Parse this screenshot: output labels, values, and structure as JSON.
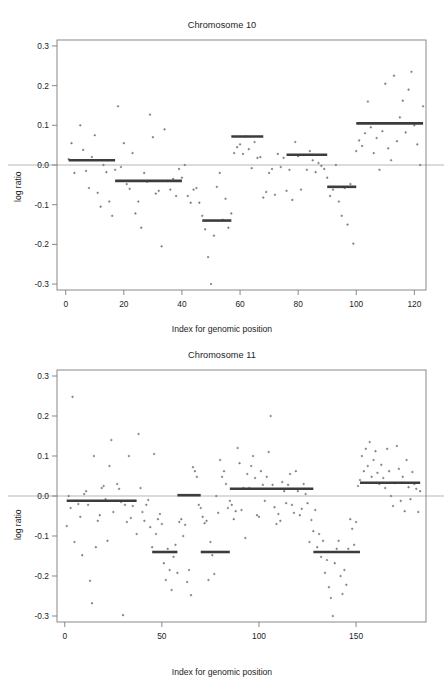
{
  "page_header": {
    "left": "",
    "right": ""
  },
  "axis_titles": {
    "x": "Index for genomic position",
    "y": "log ratio"
  },
  "colors": {
    "point": "#6f6f6f",
    "segment": "#3c3c3c",
    "zero_line": "#cfcfcf",
    "frame": "#7c7c7c",
    "text": "#1d1d1d"
  },
  "chart_data": [
    {
      "type": "scatter",
      "title": "Chromosome 10",
      "xlabel": "Index for genomic position",
      "ylabel": "log ratio",
      "xlim": [
        -3,
        124
      ],
      "ylim": [
        -0.315,
        0.315
      ],
      "xticks": [
        0,
        20,
        40,
        60,
        80,
        100,
        120
      ],
      "yticks": [
        -0.3,
        -0.2,
        -0.1,
        0.0,
        0.1,
        0.2,
        0.3
      ],
      "ytick_labels": [
        "-0.3",
        "-0.2",
        "-0.1",
        "0.0",
        "0.1",
        "0.2",
        "0.3"
      ],
      "grid": false,
      "legend": "none",
      "zero_line": 0.0,
      "points": [
        [
          1,
          0.015
        ],
        [
          2,
          0.055
        ],
        [
          3,
          -0.02
        ],
        [
          4,
          0.012
        ],
        [
          5,
          0.1
        ],
        [
          6,
          0.038
        ],
        [
          7,
          -0.015
        ],
        [
          8,
          -0.058
        ],
        [
          9,
          0.02
        ],
        [
          10,
          0.075
        ],
        [
          11,
          -0.07
        ],
        [
          12,
          -0.105
        ],
        [
          13,
          0.0
        ],
        [
          14,
          -0.018
        ],
        [
          15,
          -0.092
        ],
        [
          16,
          -0.128
        ],
        [
          17,
          -0.012
        ],
        [
          18,
          0.148
        ],
        [
          19,
          -0.005
        ],
        [
          20,
          0.055
        ],
        [
          21,
          -0.048
        ],
        [
          22,
          -0.06
        ],
        [
          23,
          0.03
        ],
        [
          24,
          -0.122
        ],
        [
          25,
          -0.092
        ],
        [
          26,
          -0.158
        ],
        [
          27,
          -0.02
        ],
        [
          28,
          -0.042
        ],
        [
          29,
          0.127
        ],
        [
          30,
          0.07
        ],
        [
          31,
          -0.072
        ],
        [
          32,
          -0.065
        ],
        [
          33,
          -0.205
        ],
        [
          34,
          0.09
        ],
        [
          35,
          -0.04
        ],
        [
          36,
          -0.062
        ],
        [
          37,
          -0.035
        ],
        [
          38,
          -0.078
        ],
        [
          39,
          -0.01
        ],
        [
          40,
          -0.032
        ],
        [
          41,
          0.0
        ],
        [
          42,
          -0.078
        ],
        [
          43,
          -0.095
        ],
        [
          44,
          -0.062
        ],
        [
          45,
          -0.058
        ],
        [
          46,
          -0.095
        ],
        [
          47,
          -0.128
        ],
        [
          48,
          -0.162
        ],
        [
          49,
          -0.232
        ],
        [
          50,
          -0.3
        ],
        [
          51,
          -0.178
        ],
        [
          52,
          -0.055
        ],
        [
          53,
          -0.02
        ],
        [
          54,
          -0.138
        ],
        [
          55,
          -0.085
        ],
        [
          56,
          -0.158
        ],
        [
          57,
          -0.122
        ],
        [
          58,
          0.03
        ],
        [
          59,
          0.045
        ],
        [
          60,
          0.052
        ],
        [
          61,
          0.028
        ],
        [
          62,
          0.072
        ],
        [
          63,
          0.04
        ],
        [
          64,
          -0.008
        ],
        [
          65,
          0.058
        ],
        [
          66,
          0.018
        ],
        [
          67,
          0.02
        ],
        [
          68,
          -0.082
        ],
        [
          69,
          -0.068
        ],
        [
          70,
          -0.02
        ],
        [
          71,
          -0.01
        ],
        [
          72,
          -0.075
        ],
        [
          73,
          0.028
        ],
        [
          74,
          -0.005
        ],
        [
          75,
          0.018
        ],
        [
          76,
          -0.065
        ],
        [
          77,
          -0.012
        ],
        [
          78,
          -0.088
        ],
        [
          79,
          0.058
        ],
        [
          80,
          0.022
        ],
        [
          81,
          -0.062
        ],
        [
          82,
          0.025
        ],
        [
          83,
          -0.012
        ],
        [
          84,
          0.035
        ],
        [
          85,
          0.012
        ],
        [
          86,
          -0.018
        ],
        [
          87,
          0.005
        ],
        [
          88,
          -0.002
        ],
        [
          89,
          -0.01
        ],
        [
          90,
          -0.032
        ],
        [
          91,
          -0.078
        ],
        [
          92,
          -0.062
        ],
        [
          93,
          0.0
        ],
        [
          94,
          -0.092
        ],
        [
          95,
          -0.128
        ],
        [
          96,
          -0.058
        ],
        [
          97,
          -0.15
        ],
        [
          98,
          -0.048
        ],
        [
          99,
          -0.198
        ],
        [
          100,
          0.035
        ],
        [
          101,
          0.062
        ],
        [
          102,
          0.048
        ],
        [
          103,
          0.08
        ],
        [
          104,
          0.16
        ],
        [
          105,
          0.095
        ],
        [
          106,
          0.03
        ],
        [
          107,
          0.068
        ],
        [
          108,
          -0.012
        ],
        [
          109,
          0.085
        ],
        [
          110,
          0.205
        ],
        [
          111,
          0.042
        ],
        [
          112,
          0.012
        ],
        [
          113,
          0.225
        ],
        [
          114,
          0.06
        ],
        [
          115,
          0.12
        ],
        [
          116,
          0.162
        ],
        [
          117,
          0.082
        ],
        [
          118,
          0.19
        ],
        [
          119,
          0.235
        ],
        [
          120,
          0.1
        ],
        [
          121,
          0.052
        ],
        [
          122,
          0.0
        ],
        [
          123,
          0.148
        ]
      ],
      "segments": [
        {
          "x0": 1,
          "x1": 17,
          "value": 0.012
        },
        {
          "x0": 17,
          "x1": 40,
          "value": -0.04
        },
        {
          "x0": 47,
          "x1": 57,
          "value": -0.14
        },
        {
          "x0": 57,
          "x1": 68,
          "value": 0.072
        },
        {
          "x0": 76,
          "x1": 90,
          "value": 0.026
        },
        {
          "x0": 90,
          "x1": 100,
          "value": -0.055
        },
        {
          "x0": 100,
          "x1": 123,
          "value": 0.105
        }
      ]
    },
    {
      "type": "scatter",
      "title": "Chromosome 11",
      "xlabel": "Index for genomic position",
      "ylabel": "log ratio",
      "xlim": [
        -4,
        186
      ],
      "ylim": [
        -0.315,
        0.315
      ],
      "xticks": [
        0,
        50,
        100,
        150
      ],
      "yticks": [
        -0.3,
        -0.2,
        -0.1,
        0.0,
        0.1,
        0.2,
        0.3
      ],
      "ytick_labels": [
        "-0.3",
        "-0.2",
        "-0.1",
        "0.0",
        "0.1",
        "0.2",
        "0.3"
      ],
      "grid": false,
      "legend": "none",
      "zero_line": 0.0,
      "points": [
        [
          1,
          -0.075
        ],
        [
          2,
          0.0
        ],
        [
          3,
          -0.03
        ],
        [
          4,
          0.248
        ],
        [
          5,
          -0.115
        ],
        [
          6,
          -0.012
        ],
        [
          7,
          -0.02
        ],
        [
          8,
          -0.052
        ],
        [
          9,
          -0.148
        ],
        [
          10,
          0.005
        ],
        [
          11,
          0.012
        ],
        [
          12,
          -0.022
        ],
        [
          13,
          -0.212
        ],
        [
          14,
          -0.268
        ],
        [
          15,
          0.1
        ],
        [
          16,
          -0.128
        ],
        [
          17,
          -0.062
        ],
        [
          18,
          -0.048
        ],
        [
          19,
          0.02
        ],
        [
          20,
          0.025
        ],
        [
          21,
          -0.008
        ],
        [
          22,
          -0.112
        ],
        [
          23,
          0.075
        ],
        [
          24,
          0.14
        ],
        [
          25,
          -0.04
        ],
        [
          26,
          -0.012
        ],
        [
          27,
          0.03
        ],
        [
          28,
          0.018
        ],
        [
          29,
          -0.015
        ],
        [
          30,
          -0.298
        ],
        [
          31,
          -0.022
        ],
        [
          32,
          -0.065
        ],
        [
          33,
          0.1
        ],
        [
          34,
          -0.055
        ],
        [
          35,
          -0.025
        ],
        [
          36,
          -0.012
        ],
        [
          37,
          -0.095
        ],
        [
          38,
          0.155
        ],
        [
          39,
          0.02
        ],
        [
          40,
          -0.04
        ],
        [
          41,
          -0.062
        ],
        [
          42,
          -0.022
        ],
        [
          43,
          -0.01
        ],
        [
          44,
          -0.078
        ],
        [
          45,
          -0.128
        ],
        [
          46,
          0.105
        ],
        [
          47,
          -0.095
        ],
        [
          48,
          -0.058
        ],
        [
          49,
          -0.045
        ],
        [
          50,
          -0.07
        ],
        [
          51,
          -0.168
        ],
        [
          52,
          -0.21
        ],
        [
          53,
          -0.132
        ],
        [
          54,
          -0.185
        ],
        [
          55,
          -0.235
        ],
        [
          56,
          -0.152
        ],
        [
          57,
          -0.122
        ],
        [
          58,
          -0.192
        ],
        [
          59,
          -0.065
        ],
        [
          60,
          -0.058
        ],
        [
          61,
          -0.1
        ],
        [
          62,
          -0.072
        ],
        [
          63,
          -0.215
        ],
        [
          64,
          -0.185
        ],
        [
          65,
          -0.248
        ],
        [
          66,
          0.072
        ],
        [
          67,
          0.062
        ],
        [
          68,
          0.048
        ],
        [
          69,
          -0.022
        ],
        [
          70,
          -0.03
        ],
        [
          71,
          -0.052
        ],
        [
          72,
          -0.068
        ],
        [
          73,
          -0.062
        ],
        [
          74,
          -0.21
        ],
        [
          75,
          -0.115
        ],
        [
          76,
          -0.148
        ],
        [
          77,
          -0.195
        ],
        [
          78,
          0.0
        ],
        [
          79,
          -0.042
        ],
        [
          80,
          0.09
        ],
        [
          81,
          0.048
        ],
        [
          82,
          0.062
        ],
        [
          83,
          0.03
        ],
        [
          84,
          -0.03
        ],
        [
          85,
          -0.012
        ],
        [
          86,
          -0.022
        ],
        [
          87,
          -0.058
        ],
        [
          88,
          -0.038
        ],
        [
          89,
          0.12
        ],
        [
          90,
          0.082
        ],
        [
          91,
          -0.035
        ],
        [
          92,
          0.02
        ],
        [
          93,
          -0.105
        ],
        [
          94,
          0.055
        ],
        [
          95,
          0.02
        ],
        [
          96,
          0.075
        ],
        [
          97,
          0.1
        ],
        [
          98,
          0.045
        ],
        [
          99,
          -0.048
        ],
        [
          100,
          -0.052
        ],
        [
          101,
          0.062
        ],
        [
          102,
          0.028
        ],
        [
          103,
          -0.012
        ],
        [
          104,
          0.048
        ],
        [
          105,
          0.11
        ],
        [
          106,
          0.2
        ],
        [
          107,
          0.028
        ],
        [
          108,
          -0.028
        ],
        [
          109,
          -0.07
        ],
        [
          110,
          -0.045
        ],
        [
          111,
          -0.062
        ],
        [
          112,
          0.035
        ],
        [
          113,
          0.012
        ],
        [
          114,
          -0.018
        ],
        [
          115,
          0.028
        ],
        [
          116,
          0.055
        ],
        [
          117,
          -0.022
        ],
        [
          118,
          -0.042
        ],
        [
          119,
          0.062
        ],
        [
          120,
          0.012
        ],
        [
          121,
          -0.048
        ],
        [
          122,
          -0.032
        ],
        [
          123,
          0.03
        ],
        [
          124,
          0.005
        ],
        [
          125,
          -0.018
        ],
        [
          126,
          -0.115
        ],
        [
          127,
          -0.06
        ],
        [
          128,
          -0.088
        ],
        [
          129,
          -0.035
        ],
        [
          130,
          -0.128
        ],
        [
          131,
          -0.095
        ],
        [
          132,
          -0.152
        ],
        [
          133,
          -0.112
        ],
        [
          134,
          -0.192
        ],
        [
          135,
          -0.16
        ],
        [
          136,
          -0.228
        ],
        [
          137,
          -0.255
        ],
        [
          138,
          -0.3
        ],
        [
          139,
          -0.168
        ],
        [
          140,
          -0.132
        ],
        [
          141,
          -0.112
        ],
        [
          142,
          -0.2
        ],
        [
          143,
          -0.245
        ],
        [
          144,
          -0.185
        ],
        [
          145,
          -0.222
        ],
        [
          146,
          -0.132
        ],
        [
          147,
          -0.058
        ],
        [
          148,
          -0.082
        ],
        [
          149,
          -0.122
        ],
        [
          150,
          -0.065
        ],
        [
          151,
          0.025
        ],
        [
          152,
          0.04
        ],
        [
          153,
          0.1
        ],
        [
          154,
          0.062
        ],
        [
          155,
          0.118
        ],
        [
          156,
          0.075
        ],
        [
          157,
          0.135
        ],
        [
          158,
          0.048
        ],
        [
          159,
          0.09
        ],
        [
          160,
          0.112
        ],
        [
          161,
          0.058
        ],
        [
          162,
          0.03
        ],
        [
          163,
          0.078
        ],
        [
          164,
          0.045
        ],
        [
          165,
          0.02
        ],
        [
          166,
          0.118
        ],
        [
          167,
          0.062
        ],
        [
          168,
          0.0
        ],
        [
          169,
          -0.025
        ],
        [
          170,
          0.032
        ],
        [
          171,
          0.125
        ],
        [
          172,
          0.068
        ],
        [
          173,
          -0.012
        ],
        [
          174,
          0.048
        ],
        [
          175,
          -0.038
        ],
        [
          176,
          0.09
        ],
        [
          177,
          0.022
        ],
        [
          178,
          -0.008
        ],
        [
          179,
          0.06
        ],
        [
          180,
          0.03
        ],
        [
          181,
          0.018
        ],
        [
          182,
          -0.04
        ],
        [
          183,
          0.012
        ]
      ],
      "segments": [
        {
          "x0": 1,
          "x1": 37,
          "value": -0.012
        },
        {
          "x0": 45,
          "x1": 58,
          "value": -0.14
        },
        {
          "x0": 58,
          "x1": 70,
          "value": 0.002
        },
        {
          "x0": 70,
          "x1": 85,
          "value": -0.14
        },
        {
          "x0": 85,
          "x1": 128,
          "value": 0.018
        },
        {
          "x0": 128,
          "x1": 152,
          "value": -0.14
        },
        {
          "x0": 152,
          "x1": 183,
          "value": 0.033
        }
      ]
    }
  ]
}
